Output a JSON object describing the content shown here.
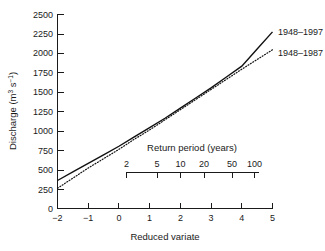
{
  "chart_data": {
    "type": "line",
    "title": "",
    "xlabel": "Reduced variate",
    "ylabel": "Discharge (m3 s-1)",
    "ylabel_parts": {
      "base": "Discharge (m",
      "sup1": "3",
      "mid": " s",
      "sup2": "−1",
      "tail": ")"
    },
    "xlim": [
      -2,
      5
    ],
    "ylim": [
      0,
      2500
    ],
    "xticks": [
      -2,
      -1,
      0,
      1,
      2,
      3,
      4,
      5
    ],
    "xtick_labels": [
      "−2",
      "−1",
      "0",
      "1",
      "2",
      "3",
      "4",
      "5"
    ],
    "yticks": [
      0,
      250,
      500,
      750,
      1000,
      1250,
      1500,
      1750,
      2000,
      2250,
      2500
    ],
    "ytick_labels": [
      "0",
      "250",
      "500",
      "750",
      "1000",
      "1250",
      "1500",
      "1750",
      "2000",
      "2250",
      "2500"
    ],
    "grid": false,
    "legend_position": "right-inline-labels",
    "secondary_axis": {
      "title": "Return period (years)",
      "ticks": [
        2,
        5,
        10,
        20,
        50,
        100
      ],
      "tick_labels": [
        "2",
        "5",
        "10",
        "20",
        "50",
        "100"
      ],
      "tick_reduced_variate": [
        0.367,
        1.5,
        2.25,
        2.97,
        3.9,
        4.6
      ]
    },
    "series": [
      {
        "name": "1948–1997",
        "style": "solid",
        "color": "#111111",
        "x": [
          -2,
          -1.5,
          -1,
          -0.5,
          0,
          0.5,
          1,
          1.5,
          2,
          2.5,
          3,
          3.5,
          4,
          4.5,
          5
        ],
        "values": [
          360,
          470,
          580,
          690,
          800,
          920,
          1040,
          1160,
          1290,
          1420,
          1550,
          1690,
          1830,
          2050,
          2270
        ]
      },
      {
        "name": "1948–1987",
        "style": "dotted",
        "color": "#111111",
        "x": [
          -2,
          -1.5,
          -1,
          -0.5,
          0,
          0.5,
          1,
          1.5,
          2,
          2.5,
          3,
          3.5,
          4,
          4.5,
          5
        ],
        "values": [
          260,
          390,
          520,
          640,
          760,
          890,
          1010,
          1140,
          1270,
          1400,
          1530,
          1660,
          1790,
          1915,
          2040
        ]
      }
    ]
  },
  "labels": {
    "series_1_label": "1948–1997",
    "series_2_label": "1948–1987",
    "x_axis_title": "Reduced variate",
    "secondary_axis_title": "Return period (years)"
  },
  "colors": {
    "background": "#ffffff",
    "ink": "#1a1a1a",
    "curve": "#111111"
  }
}
